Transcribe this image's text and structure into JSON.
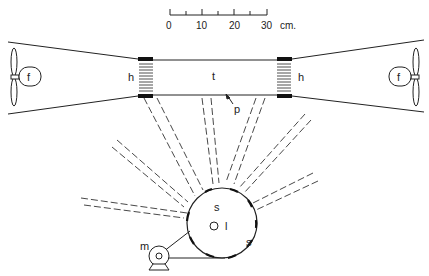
{
  "scale": {
    "ticks": [
      "0",
      "10",
      "20",
      "30"
    ],
    "unit": "cm."
  },
  "labels": {
    "fan_left": "f",
    "fan_right": "f",
    "honeycomb_left": "h",
    "honeycomb_right": "h",
    "tunnel": "t",
    "plate": "p",
    "sun_top": "s",
    "sun_side": "s",
    "lamp": "l",
    "motor": "m"
  },
  "colors": {
    "ink": "#222222",
    "background": "#ffffff"
  }
}
